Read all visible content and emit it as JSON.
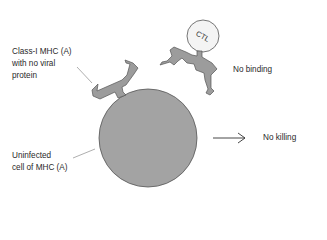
{
  "labels": {
    "mhc_line1": "Class-I MHC (A)",
    "mhc_line2": "with no viral",
    "mhc_line3": "protein",
    "ctl": "CTL",
    "no_binding": "No binding",
    "no_killing": "No killing",
    "cell_line1": "Uninfected",
    "cell_line2": "cell of MHC (A)"
  },
  "colors": {
    "cell_fill": "#a3a3a3",
    "molecule_fill": "#9c9c9c",
    "ctl_fill": "#f4f4f4",
    "outline": "#555555",
    "text": "#2a2a2a"
  },
  "icons": {
    "arrow": "right-arrow-icon"
  }
}
